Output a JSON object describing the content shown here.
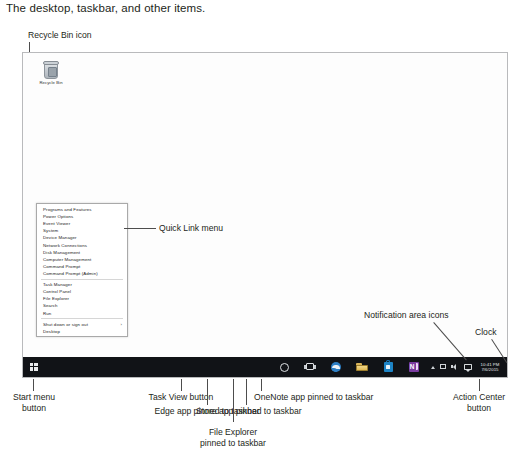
{
  "caption": "The desktop, taskbar, and other items.",
  "desktop": {
    "recycle_bin": {
      "label": "Recycle Bin",
      "icon": "recycle-bin-icon"
    }
  },
  "quick_link_menu": {
    "groups": [
      {
        "items": [
          {
            "label": "Programs and Features",
            "submenu": false
          },
          {
            "label": "Power Options",
            "submenu": false
          },
          {
            "label": "Event Viewer",
            "submenu": false
          },
          {
            "label": "System",
            "submenu": false
          },
          {
            "label": "Device Manager",
            "submenu": false
          },
          {
            "label": "Network Connections",
            "submenu": false
          },
          {
            "label": "Disk Management",
            "submenu": false
          },
          {
            "label": "Computer Management",
            "submenu": false
          },
          {
            "label": "Command Prompt",
            "submenu": false
          },
          {
            "label": "Command Prompt (Admin)",
            "submenu": false
          }
        ]
      },
      {
        "items": [
          {
            "label": "Task Manager",
            "submenu": false
          },
          {
            "label": "Control Panel",
            "submenu": false
          },
          {
            "label": "File Explorer",
            "submenu": false
          },
          {
            "label": "Search",
            "submenu": false
          },
          {
            "label": "Run",
            "submenu": false
          }
        ]
      },
      {
        "items": [
          {
            "label": "Shut down or sign out",
            "submenu": true,
            "arrow": "›"
          },
          {
            "label": "Desktop",
            "submenu": false
          }
        ]
      }
    ]
  },
  "taskbar": {
    "start_button_icon": "windows-logo-icon",
    "pinned": [
      {
        "name": "cortana-search-icon"
      },
      {
        "name": "task-view-icon"
      },
      {
        "name": "edge-icon"
      },
      {
        "name": "file-explorer-icon"
      },
      {
        "name": "store-icon"
      },
      {
        "name": "onenote-icon"
      }
    ],
    "notification_icons": [
      {
        "name": "show-hidden-icons-chevron-icon"
      },
      {
        "name": "network-icon"
      },
      {
        "name": "volume-icon"
      }
    ],
    "action_center_icon": "action-center-icon",
    "clock": {
      "time": "10:41 PM",
      "date": "7/6/2015"
    }
  },
  "annotations": {
    "recycle_bin": "Recycle Bin icon",
    "quick_link_menu": "Quick Link menu",
    "notification_area": "Notification area icons",
    "clock": "Clock",
    "start_menu_button": "Start menu\nbutton",
    "start_menu_button_l1": "Start menu",
    "start_menu_button_l2": "button",
    "task_view_button": "Task View button",
    "edge_app": "Edge app pinned to taskbar",
    "file_explorer_l1": "File Explorer",
    "file_explorer_l2": "pinned to taskbar",
    "store_app": "Store app pinned to taskbar",
    "onenote_app": "OneNote app pinned to taskbar",
    "action_center_l1": "Action Center",
    "action_center_l2": "button"
  }
}
